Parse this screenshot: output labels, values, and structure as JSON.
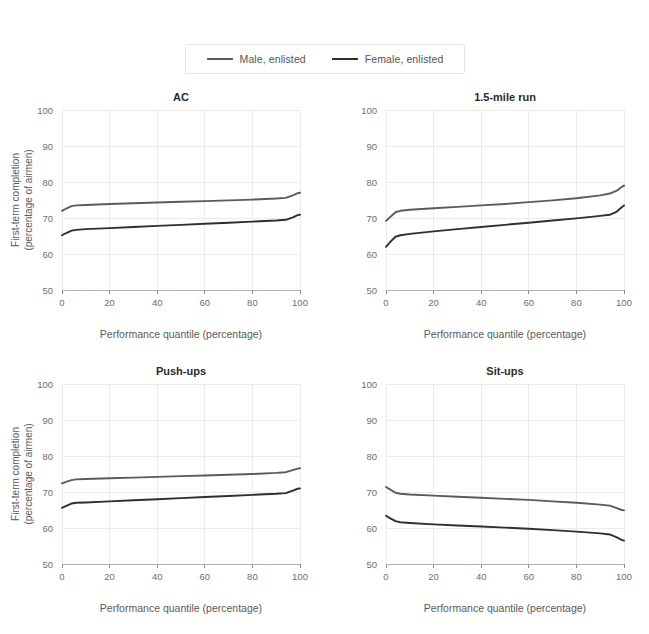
{
  "figure": {
    "background": "#ffffff",
    "axis_title_x": "Performance quantile (percentage)",
    "axis_title_y_line1": "First-term completion",
    "axis_title_y_line2": "(percentage of airmen)"
  },
  "legend": {
    "position": "top-center",
    "items": [
      {
        "label": "Male, enlisted",
        "color": "#5b5b5b",
        "name": "male-enlisted"
      },
      {
        "label": "Female, enlisted",
        "color": "#2f2f2f",
        "name": "female-enlisted"
      }
    ]
  },
  "chart_data": {
    "type": "line",
    "title": "",
    "xlabel": "Performance quantile (percentage)",
    "ylabel": "First-term completion (percentage of airmen)",
    "xlim": [
      0,
      100
    ],
    "ylim": [
      50,
      100
    ],
    "xticks": [
      0,
      20,
      40,
      60,
      80,
      100
    ],
    "yticks": [
      50,
      60,
      70,
      80,
      90,
      100
    ],
    "grid": true,
    "legend_position": "top-center",
    "panels": [
      {
        "title": "AC",
        "series": [
          {
            "name": "Male, enlisted",
            "color": "#5b5b5b",
            "x": [
              0,
              2,
              4,
              6,
              10,
              20,
              30,
              40,
              50,
              60,
              70,
              80,
              90,
              94,
              97,
              99,
              100
            ],
            "values": [
              72.0,
              72.7,
              73.3,
              73.5,
              73.6,
              73.9,
              74.1,
              74.3,
              74.5,
              74.7,
              74.9,
              75.1,
              75.4,
              75.6,
              76.3,
              76.9,
              77.0
            ]
          },
          {
            "name": "Female, enlisted",
            "color": "#2f2f2f",
            "x": [
              0,
              2,
              4,
              6,
              10,
              20,
              30,
              40,
              50,
              60,
              70,
              80,
              90,
              94,
              97,
              99,
              100
            ],
            "values": [
              65.2,
              65.9,
              66.5,
              66.7,
              66.9,
              67.2,
              67.5,
              67.8,
              68.1,
              68.4,
              68.7,
              69.0,
              69.3,
              69.5,
              70.2,
              70.8,
              70.9
            ]
          }
        ]
      },
      {
        "title": "1.5-mile run",
        "series": [
          {
            "name": "Male, enlisted",
            "color": "#5b5b5b",
            "x": [
              0,
              2,
              4,
              6,
              10,
              20,
              30,
              40,
              50,
              60,
              70,
              80,
              90,
              94,
              97,
              99,
              100
            ],
            "values": [
              69.2,
              70.4,
              71.6,
              72.0,
              72.3,
              72.7,
              73.1,
              73.5,
              73.9,
              74.4,
              74.9,
              75.5,
              76.3,
              76.8,
              77.6,
              78.6,
              79.0
            ]
          },
          {
            "name": "Female, enlisted",
            "color": "#2f2f2f",
            "x": [
              0,
              2,
              4,
              6,
              10,
              20,
              30,
              40,
              50,
              60,
              70,
              80,
              90,
              94,
              97,
              99,
              100
            ],
            "values": [
              62.0,
              63.5,
              64.8,
              65.2,
              65.6,
              66.3,
              66.9,
              67.5,
              68.1,
              68.7,
              69.3,
              69.9,
              70.6,
              70.9,
              71.8,
              73.0,
              73.5
            ]
          }
        ]
      },
      {
        "title": "Push-ups",
        "series": [
          {
            "name": "Male, enlisted",
            "color": "#5b5b5b",
            "x": [
              0,
              2,
              4,
              6,
              10,
              20,
              30,
              40,
              50,
              60,
              70,
              80,
              90,
              94,
              97,
              99,
              100
            ],
            "values": [
              72.4,
              72.9,
              73.3,
              73.5,
              73.6,
              73.8,
              74.0,
              74.2,
              74.4,
              74.6,
              74.8,
              75.0,
              75.3,
              75.5,
              76.1,
              76.5,
              76.6
            ]
          },
          {
            "name": "Female, enlisted",
            "color": "#2f2f2f",
            "x": [
              0,
              2,
              4,
              6,
              10,
              20,
              30,
              40,
              50,
              60,
              70,
              80,
              90,
              94,
              97,
              99,
              100
            ],
            "values": [
              65.6,
              66.2,
              66.8,
              67.0,
              67.1,
              67.4,
              67.7,
              68.0,
              68.3,
              68.6,
              68.9,
              69.2,
              69.5,
              69.7,
              70.4,
              70.9,
              71.0
            ]
          }
        ]
      },
      {
        "title": "Sit-ups",
        "series": [
          {
            "name": "Male, enlisted",
            "color": "#5b5b5b",
            "x": [
              0,
              2,
              4,
              6,
              10,
              20,
              30,
              40,
              50,
              60,
              70,
              80,
              90,
              94,
              97,
              99,
              100
            ],
            "values": [
              71.4,
              70.6,
              69.8,
              69.5,
              69.3,
              69.0,
              68.7,
              68.4,
              68.1,
              67.8,
              67.4,
              67.0,
              66.5,
              66.2,
              65.5,
              65.0,
              64.9
            ]
          },
          {
            "name": "Female, enlisted",
            "color": "#2f2f2f",
            "x": [
              0,
              2,
              4,
              6,
              10,
              20,
              30,
              40,
              50,
              60,
              70,
              80,
              90,
              94,
              97,
              99,
              100
            ],
            "values": [
              63.4,
              62.6,
              61.9,
              61.6,
              61.4,
              61.0,
              60.7,
              60.4,
              60.1,
              59.8,
              59.4,
              59.0,
              58.5,
              58.2,
              57.4,
              56.7,
              56.5
            ]
          }
        ]
      }
    ]
  }
}
